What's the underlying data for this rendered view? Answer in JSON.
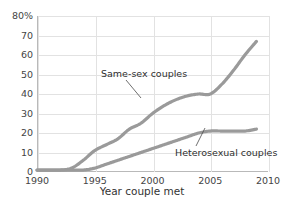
{
  "chart_data": {
    "type": "line",
    "title": "",
    "subtitle": "",
    "xlabel": "Year couple met",
    "ylabel": "",
    "xlim": [
      1990,
      2010
    ],
    "ylim": [
      0,
      80
    ],
    "grid": true,
    "legend_position": "inline-annotations",
    "x_ticks": [
      "1990",
      "1995",
      "2000",
      "2005",
      "2010"
    ],
    "x_tick_values": [
      1990,
      1995,
      2000,
      2005,
      2010
    ],
    "y_ticks": [
      "0",
      "10",
      "20",
      "30",
      "40",
      "50",
      "60",
      "70",
      "80%"
    ],
    "y_tick_values": [
      0,
      10,
      20,
      30,
      40,
      50,
      60,
      70,
      80
    ],
    "series": [
      {
        "name": "Same-sex couples",
        "color": "#9a9a9a",
        "x": [
          1990,
          1991,
          1992,
          1993,
          1994,
          1995,
          1996,
          1997,
          1998,
          1999,
          2000,
          2001,
          2002,
          2003,
          2004,
          2005,
          2006,
          2007,
          2008,
          2009
        ],
        "values": [
          1,
          1,
          1,
          2,
          6,
          11,
          14,
          17,
          22,
          25,
          30,
          34,
          37,
          39,
          40,
          40,
          45,
          52,
          60,
          67
        ]
      },
      {
        "name": "Heterosexual couples",
        "color": "#9a9a9a",
        "x": [
          1990,
          1991,
          1992,
          1993,
          1994,
          1995,
          1996,
          1997,
          1998,
          1999,
          2000,
          2001,
          2002,
          2003,
          2004,
          2005,
          2006,
          2007,
          2008,
          2009
        ],
        "values": [
          1,
          1,
          1,
          1,
          1,
          2,
          4,
          6,
          8,
          10,
          12,
          14,
          16,
          18,
          20,
          21,
          21,
          21,
          21,
          22
        ]
      }
    ],
    "annotations": [
      {
        "text": "Same-sex couples",
        "target_x": 2003,
        "target_y": 39
      },
      {
        "text": "Heterosexual couples",
        "target_x": 2006,
        "target_y": 21
      }
    ]
  },
  "axes": {
    "x_title": "Year couple met",
    "y_ticks": [
      "80%",
      "70",
      "60",
      "50",
      "40",
      "30",
      "20",
      "10",
      "0"
    ],
    "x_ticks": [
      "1990",
      "1995",
      "2000",
      "2005",
      "2010"
    ]
  },
  "labels": {
    "same_sex": "Same-sex couples",
    "heterosexual": "Heterosexual couples"
  },
  "colors": {
    "line": "#9a9a9a",
    "grid": "#e2e2e2",
    "axis": "#b9b9b9",
    "text": "#3b3b3b",
    "background": "#ffffff"
  }
}
